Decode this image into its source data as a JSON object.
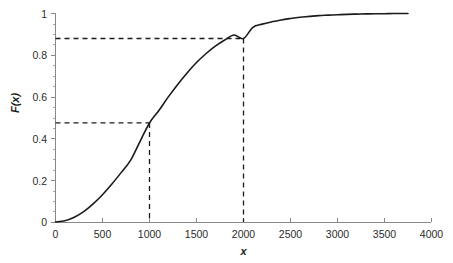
{
  "chart_data": {
    "type": "line",
    "title": "",
    "subtitle": "",
    "xlabel": "x",
    "ylabel": "F(x)",
    "xlim": [
      0,
      4000
    ],
    "ylim": [
      0,
      1
    ],
    "grid": false,
    "legend": null,
    "x_ticks": [
      0,
      500,
      1000,
      1500,
      2000,
      2500,
      3000,
      3500,
      4000
    ],
    "x_tick_labels": [
      "0",
      "500",
      "1000",
      "1500",
      "2000",
      "2500",
      "3000",
      "3500",
      "4000"
    ],
    "y_ticks": [
      0,
      0.2,
      0.4,
      0.6,
      0.8,
      1
    ],
    "y_tick_labels": [
      "0",
      "0.2",
      "0.4",
      "0.6",
      "0.8",
      "1"
    ],
    "y_minor_tick_step": 0.05,
    "series": [
      {
        "name": "F(x)",
        "color": "#1b1b1b",
        "style": "solid",
        "x": [
          0,
          100,
          200,
          300,
          400,
          500,
          600,
          700,
          800,
          900,
          1000,
          1100,
          1200,
          1300,
          1400,
          1500,
          1600,
          1700,
          1800,
          1900,
          2000,
          2100,
          2200,
          2300,
          2400,
          2500,
          2600,
          2700,
          2800,
          2900,
          3000,
          3100,
          3200,
          3300,
          3400,
          3500,
          3600,
          3750
        ],
        "y": [
          0.0,
          0.006,
          0.023,
          0.05,
          0.087,
          0.131,
          0.182,
          0.238,
          0.297,
          0.387,
          0.475,
          0.535,
          0.6,
          0.66,
          0.715,
          0.765,
          0.807,
          0.843,
          0.873,
          0.897,
          0.88,
          0.934,
          0.949,
          0.96,
          0.969,
          0.976,
          0.982,
          0.986,
          0.99,
          0.992,
          0.994,
          0.996,
          0.997,
          0.998,
          0.999,
          0.999,
          1.0,
          1.0
        ]
      }
    ],
    "annotations": [
      {
        "name": "guide-1000",
        "kind": "dashed-crosshair",
        "x": 1000,
        "y": 0.475,
        "label": ""
      },
      {
        "name": "guide-2000",
        "kind": "dashed-crosshair",
        "x": 2000,
        "y": 0.88,
        "label": ""
      }
    ]
  },
  "axes": {
    "y_labels": {
      "t0": "0",
      "t1": "0.2",
      "t2": "0.4",
      "t3": "0.6",
      "t4": "0.8",
      "t5": "1"
    },
    "x_labels": {
      "t0": "0",
      "t1": "500",
      "t2": "1000",
      "t3": "1500",
      "t4": "2000",
      "t5": "2500",
      "t6": "3000",
      "t7": "3500",
      "t8": "4000"
    },
    "x_title": "x",
    "y_title": "F(x)"
  },
  "colors": {
    "curve": "#1b1b1b",
    "guide": "#1b1b1b",
    "axis": "#888888",
    "text": "#2b2b2b",
    "background": "#ffffff"
  }
}
